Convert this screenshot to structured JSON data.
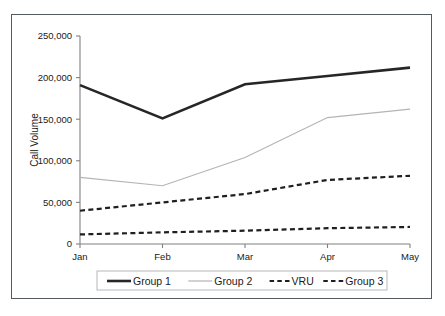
{
  "chart_data": {
    "type": "line",
    "title": "",
    "xlabel": "",
    "ylabel": "Call Volume",
    "categories": [
      "Jan",
      "Feb",
      "Mar",
      "Apr",
      "May"
    ],
    "ylim": [
      0,
      250000
    ],
    "ytick_values": [
      0,
      50000,
      100000,
      150000,
      200000,
      250000
    ],
    "ytick_labels": [
      "0",
      "50,000",
      "100,000",
      "150,000",
      "200,000",
      "250,000"
    ],
    "grid": false,
    "legend_position": "bottom",
    "series": [
      {
        "name": "Group 1",
        "values": [
          191000,
          151000,
          192000,
          202000,
          212000
        ],
        "style": "solid",
        "color": "#262626",
        "width": 2.6
      },
      {
        "name": "Group 2",
        "values": [
          80000,
          70000,
          104000,
          152000,
          162000
        ],
        "style": "solid",
        "color": "#b4b4b4",
        "width": 1.2
      },
      {
        "name": "VRU",
        "values": [
          40000,
          50000,
          60000,
          77000,
          82000
        ],
        "style": "dashed",
        "color": "#1f1f1f",
        "width": 2.2
      },
      {
        "name": "Group 3",
        "values": [
          11500,
          14000,
          16000,
          19000,
          20500
        ],
        "style": "dashed",
        "color": "#1f1f1f",
        "width": 2.2
      }
    ]
  },
  "legend": {
    "entries": [
      {
        "label": "Group 1"
      },
      {
        "label": "Group 2"
      },
      {
        "label": "VRU"
      },
      {
        "label": "Group 3"
      }
    ]
  },
  "colors": {
    "border": "#555a5e",
    "axis": "#808080",
    "text": "#1a1a1a",
    "series_dark": "#262626",
    "series_gray": "#b4b4b4",
    "background": "#ffffff"
  }
}
